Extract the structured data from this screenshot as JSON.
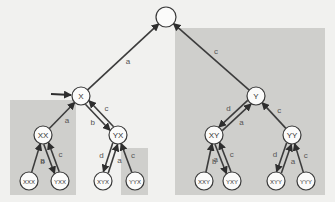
{
  "diagram": {
    "type": "binary-tree",
    "colors": {
      "background": "#f1f1ef",
      "shaded_region": "#cfcfcc",
      "edge": "#3c3c3c",
      "node_fill": "#fbfbfa"
    },
    "nodes": [
      {
        "id": "root",
        "label": ""
      },
      {
        "id": "X",
        "label": "X"
      },
      {
        "id": "Y",
        "label": "Y"
      },
      {
        "id": "XX",
        "label": "XX"
      },
      {
        "id": "YX",
        "label": "YX"
      },
      {
        "id": "XY",
        "label": "XY"
      },
      {
        "id": "YY",
        "label": "YY"
      },
      {
        "id": "XXX",
        "label": "XXX"
      },
      {
        "id": "YXX",
        "label": "YXX"
      },
      {
        "id": "XYX",
        "label": "XYX"
      },
      {
        "id": "YYX",
        "label": "YYX"
      },
      {
        "id": "XXY",
        "label": "XXY"
      },
      {
        "id": "YXY",
        "label": "YXY"
      },
      {
        "id": "XYY",
        "label": "XYY"
      },
      {
        "id": "YYY",
        "label": "YYY"
      }
    ],
    "edges": [
      {
        "from": "X",
        "to": "root",
        "label": "a"
      },
      {
        "from": "Y",
        "to": "root",
        "label": "c"
      },
      {
        "from": "X",
        "to": "YX",
        "label": "b"
      },
      {
        "from": "YX",
        "to": "X",
        "label": "c"
      },
      {
        "from": "XX",
        "to": "X",
        "label": "a"
      },
      {
        "from": "Y",
        "to": "XY",
        "label": "d"
      },
      {
        "from": "XY",
        "to": "Y",
        "label": "a"
      },
      {
        "from": "YY",
        "to": "Y",
        "label": "c"
      },
      {
        "from": "XXX",
        "to": "XX",
        "label": "a"
      },
      {
        "from": "XX",
        "to": "YXX",
        "label": "b"
      },
      {
        "from": "YXX",
        "to": "XX",
        "label": "c"
      },
      {
        "from": "YX",
        "to": "XYX",
        "label": "d"
      },
      {
        "from": "XYX",
        "to": "YX",
        "label": "a"
      },
      {
        "from": "YYX",
        "to": "YX",
        "label": "c"
      },
      {
        "from": "XXY",
        "to": "XY",
        "label": "a"
      },
      {
        "from": "XY",
        "to": "YXY",
        "label": "b"
      },
      {
        "from": "YXY",
        "to": "XY",
        "label": "c"
      },
      {
        "from": "YY",
        "to": "XYY",
        "label": "d"
      },
      {
        "from": "XYY",
        "to": "YY",
        "label": "a"
      },
      {
        "from": "YYY",
        "to": "YY",
        "label": "c"
      }
    ],
    "entry_arrow_target": "X",
    "shaded_subtrees": [
      "XX",
      "YYX",
      "Y"
    ]
  }
}
